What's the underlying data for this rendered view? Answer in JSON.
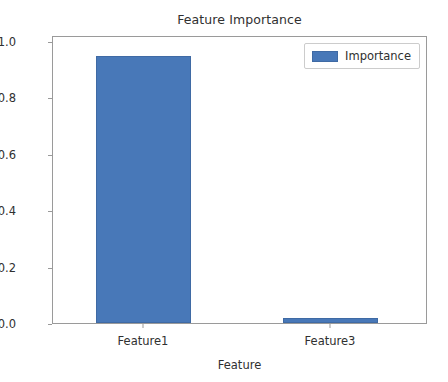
{
  "chart_data": {
    "type": "bar",
    "title": "Feature Importance",
    "xlabel": "Feature",
    "ylabel": "",
    "categories": [
      "Feature1",
      "Feature3"
    ],
    "values": [
      0.98,
      0.02
    ],
    "series": [
      {
        "name": "Importance",
        "values": [
          0.98,
          0.02
        ],
        "color": "#4878b8"
      }
    ],
    "ylim": [
      0.0,
      1.05
    ],
    "yticks": [
      "0.0",
      "0.2",
      "0.4",
      "0.6",
      "0.8",
      "1.0"
    ],
    "ytick_values": [
      0.0,
      0.2,
      0.4,
      0.6,
      0.8,
      1.0
    ],
    "xticks": [
      "Feature1",
      "Feature3"
    ],
    "grid": false,
    "legend": {
      "position": "upper right",
      "entries": [
        "Importance"
      ]
    }
  },
  "legend": {
    "label": "Importance",
    "swatch_name": "legend-color-swatch-importance"
  },
  "colors": {
    "bar": "#4878b8",
    "bar_edge": "#3f6aa4",
    "axis": "#9a9a9a",
    "text": "#303030",
    "background": "#ffffff"
  }
}
